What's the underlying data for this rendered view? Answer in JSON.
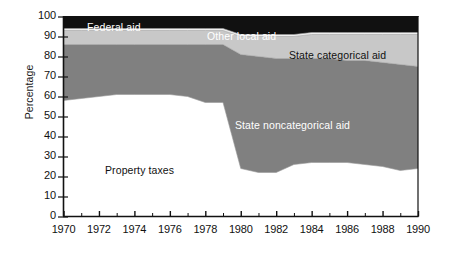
{
  "chart_data": {
    "type": "area",
    "stacked": true,
    "title": "",
    "xlabel": "",
    "ylabel": "Percentage",
    "xlim": [
      1970,
      1990
    ],
    "ylim": [
      0,
      100
    ],
    "grid": false,
    "legend_position": "inline-labels",
    "x": [
      1970,
      1971,
      1972,
      1973,
      1974,
      1975,
      1976,
      1977,
      1978,
      1979,
      1980,
      1981,
      1982,
      1983,
      1984,
      1985,
      1986,
      1987,
      1988,
      1989,
      1990
    ],
    "xticks": [
      1970,
      1972,
      1974,
      1976,
      1978,
      1980,
      1982,
      1984,
      1986,
      1988,
      1990
    ],
    "xtick_labels": [
      "1970",
      "1972",
      "1974",
      "1976",
      "1978",
      "1980",
      "1982",
      "1984",
      "1986",
      "1988",
      "1990"
    ],
    "yticks": [
      0,
      10,
      20,
      30,
      40,
      50,
      60,
      70,
      80,
      90,
      100
    ],
    "ytick_labels": [
      "0",
      "10",
      "20",
      "30",
      "40",
      "50",
      "60",
      "70",
      "80",
      "90",
      "100"
    ],
    "series": [
      {
        "name": "Property taxes",
        "color": "#ffffff",
        "label_color": "#111111",
        "values": [
          58,
          59,
          60,
          61,
          61,
          61,
          61,
          60,
          57,
          57,
          24,
          22,
          22,
          26,
          27,
          27,
          27,
          26,
          25,
          23,
          24
        ]
      },
      {
        "name": "State noncategorical aid",
        "color": "#808080",
        "label_color": "#ffffff",
        "values": [
          28,
          27,
          26,
          25,
          25,
          25,
          25,
          26,
          29,
          29,
          57,
          58,
          57,
          53,
          52,
          52,
          51,
          52,
          52,
          53,
          51
        ]
      },
      {
        "name": "State categorical aid",
        "color": "#c8c8c8",
        "label_color": "#111111",
        "values": [
          7,
          7,
          7,
          7,
          7,
          7,
          7,
          7,
          7,
          7,
          9,
          10,
          11,
          11,
          12,
          12,
          13,
          13,
          14,
          15,
          16
        ]
      },
      {
        "name": "Other local aid",
        "color": "#f0f0f0",
        "label_color": "#111111",
        "values": [
          1,
          1,
          1,
          1,
          1,
          1,
          1,
          1,
          1,
          1,
          1,
          1,
          1,
          1,
          1,
          1,
          1,
          1,
          1,
          1,
          1
        ]
      },
      {
        "name": "Federal aid",
        "color": "#111111",
        "label_color": "#ffffff",
        "values": [
          6,
          6,
          6,
          6,
          6,
          6,
          6,
          6,
          6,
          6,
          9,
          9,
          9,
          9,
          8,
          8,
          8,
          8,
          8,
          8,
          8
        ]
      }
    ],
    "annotations": [
      {
        "text": "Federal aid",
        "x_px": 87,
        "y_px": 21,
        "on": "black"
      },
      {
        "text": "Other local aid",
        "x_px": 207,
        "y_px": 30,
        "on": "black"
      },
      {
        "text": "State categorical aid",
        "x_px": 289,
        "y_px": 49,
        "on": "light"
      },
      {
        "text": "State noncategorical aid",
        "x_px": 235,
        "y_px": 119,
        "on": "dark"
      },
      {
        "text": "Property taxes",
        "x_px": 105,
        "y_px": 164,
        "on": "white"
      }
    ]
  }
}
